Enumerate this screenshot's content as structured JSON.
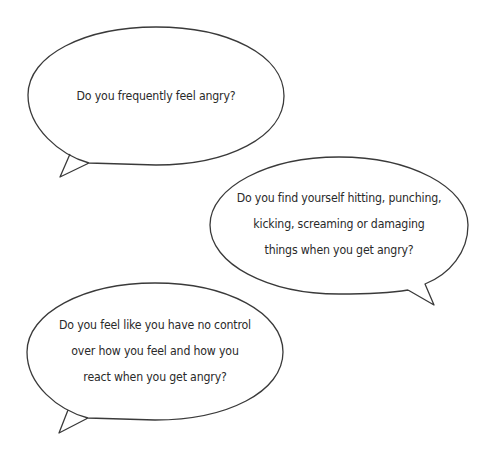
{
  "bubbles": [
    {
      "id": "bubble-1",
      "lines": [
        "Do you frequently feel angry?"
      ]
    },
    {
      "id": "bubble-2",
      "lines": [
        "Do you find yourself hitting, punching,",
        "kicking, screaming or damaging",
        "things when you get angry?"
      ]
    },
    {
      "id": "bubble-3",
      "lines": [
        "Do you feel like you have no control",
        "over how you feel and how you",
        "react when you get angry?"
      ]
    }
  ],
  "colors": {
    "outline": "#3a3a3a",
    "text": "#2a2a2a",
    "background": "#ffffff"
  }
}
